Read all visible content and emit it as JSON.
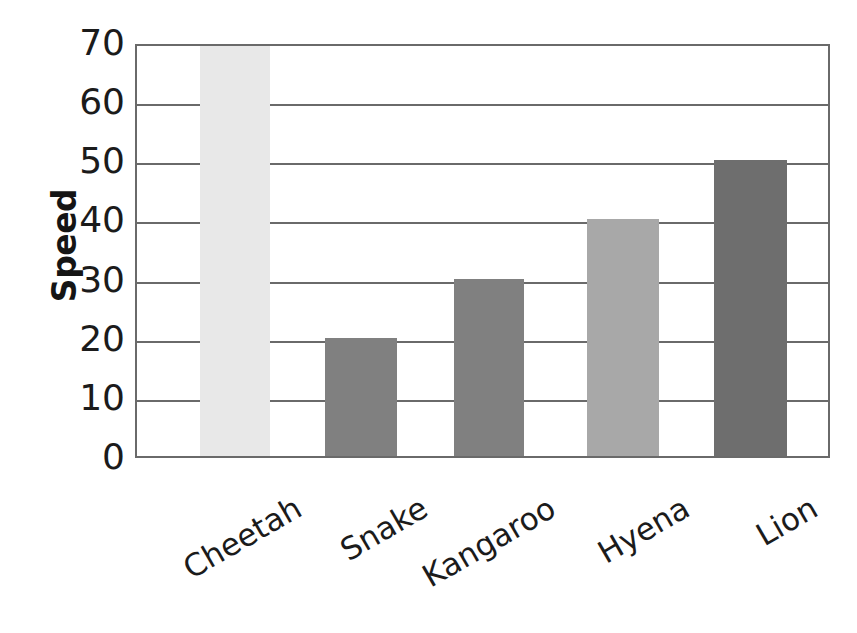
{
  "chart_data": {
    "type": "bar",
    "title": "",
    "xlabel": "",
    "ylabel": "Speed",
    "categories": [
      "Cheetah",
      "Snake",
      "Kangaroo",
      "Hyena",
      "Lion"
    ],
    "values": [
      75,
      20,
      30,
      40,
      50
    ],
    "value_labels": [
      "off-scale (clipped above 70)",
      "20",
      "30",
      "40",
      "50"
    ],
    "bar_colors": [
      "#e8e8e8",
      "#808080",
      "#808080",
      "#a8a8a8",
      "#6e6e6e"
    ],
    "ylim": [
      0,
      70
    ],
    "yticks": [
      0,
      10,
      20,
      30,
      40,
      50,
      60,
      70
    ],
    "ytick_labels": [
      "0",
      "10",
      "20",
      "30",
      "40",
      "50",
      "60",
      "70"
    ],
    "grid": true,
    "grid_color": "#6a6a6a",
    "legend": "none",
    "plot_border_color": "#6a6a6a",
    "background_color": "#ffffff",
    "xtick_label_rotation_deg": 30
  }
}
